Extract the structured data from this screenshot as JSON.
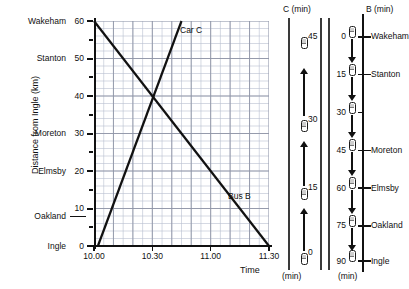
{
  "chart_data": {
    "type": "line",
    "title": "",
    "xlabel": "Time",
    "ylabel": "Distance from Ingle (km)",
    "xlim": [
      0,
      90
    ],
    "ylim": [
      0,
      60
    ],
    "x_tick_labels": [
      "10.00",
      "10.30",
      "11.00",
      "11.30"
    ],
    "x_tick_minutes": [
      0,
      30,
      60,
      90
    ],
    "y_tick_labels": [
      "0",
      "10",
      "20",
      "30",
      "40",
      "50",
      "60"
    ],
    "y_tick_values": [
      0,
      10,
      20,
      30,
      40,
      50,
      60
    ],
    "grid": "on",
    "grid_minor_x_minutes": 5,
    "grid_minor_y_km": 2,
    "place_labels": [
      {
        "name": "Wakeham",
        "km": 60
      },
      {
        "name": "Stanton",
        "km": 50
      },
      {
        "name": "Moreton",
        "km": 30
      },
      {
        "name": "Elmsby",
        "km": 20
      },
      {
        "name": "Oakland",
        "km": 8
      },
      {
        "name": "Ingle",
        "km": 0
      }
    ],
    "series": [
      {
        "name": "Bus B",
        "label": "Bus B",
        "points": [
          [
            0,
            60
          ],
          [
            90,
            0
          ]
        ],
        "color": "#111111"
      },
      {
        "name": "Car C",
        "label": "Car C",
        "points": [
          [
            2,
            0
          ],
          [
            45,
            60
          ]
        ],
        "color": "#111111"
      }
    ]
  },
  "axis": {
    "y_title": "Distance from Ingle (km)",
    "x_title": "Time",
    "y_ticks": [
      {
        "label": "60",
        "value": 60
      },
      {
        "label": "50",
        "value": 50
      },
      {
        "label": "40",
        "value": 40
      },
      {
        "label": "30",
        "value": 30
      },
      {
        "label": "20",
        "value": 20
      },
      {
        "label": "10",
        "value": 10
      },
      {
        "label": "0",
        "value": 0
      }
    ],
    "x_ticks": [
      {
        "label": "10.00",
        "value": 0
      },
      {
        "label": "10.30",
        "value": 30
      },
      {
        "label": "11.00",
        "value": 60
      },
      {
        "label": "11.30",
        "value": 90
      }
    ],
    "places": [
      {
        "label": "Wakeham",
        "value": 60
      },
      {
        "label": "Stanton",
        "value": 50
      },
      {
        "label": "Moreton",
        "value": 30
      },
      {
        "label": "Elmsby",
        "value": 20
      },
      {
        "label": "Oakland",
        "value": 8
      },
      {
        "label": "Ingle",
        "value": 0
      }
    ]
  },
  "series_labels": {
    "car": "Car C",
    "bus": "Bus B"
  },
  "strip_c": {
    "header": "C (min)",
    "footer": "(min)",
    "direction": "up",
    "stops": [
      {
        "label": "45",
        "pos": 0.1
      },
      {
        "label": "30",
        "pos": 0.43
      },
      {
        "label": "15",
        "pos": 0.7
      },
      {
        "label": "0",
        "pos": 0.955
      }
    ],
    "arrows": [
      {
        "pos_top": 0.2,
        "pos_bottom": 0.39
      },
      {
        "pos_top": 0.49,
        "pos_bottom": 0.665
      },
      {
        "pos_top": 0.755,
        "pos_bottom": 0.925
      }
    ]
  },
  "strip_b": {
    "header": "B (min)",
    "footer": "(min)",
    "direction": "down",
    "stops": [
      {
        "time": "0",
        "place": "Wakeham",
        "pos": 0.075
      },
      {
        "time": "15",
        "place": "Stanton",
        "pos": 0.225
      },
      {
        "time": "30",
        "place": "",
        "pos": 0.375
      },
      {
        "time": "45",
        "place": "Moreton",
        "pos": 0.525
      },
      {
        "time": "60",
        "place": "Elmsby",
        "pos": 0.675
      },
      {
        "time": "75",
        "place": "Oakland",
        "pos": 0.825
      },
      {
        "time": "90",
        "place": "Ingle",
        "pos": 0.965
      }
    ]
  },
  "colors": {
    "line": "#111111",
    "grid_minor": "#b9bfd0",
    "grid_major": "#8e94a6",
    "axis": "#111111",
    "bus_body": "#ffffff",
    "bus_window": "#cfcfcf"
  }
}
